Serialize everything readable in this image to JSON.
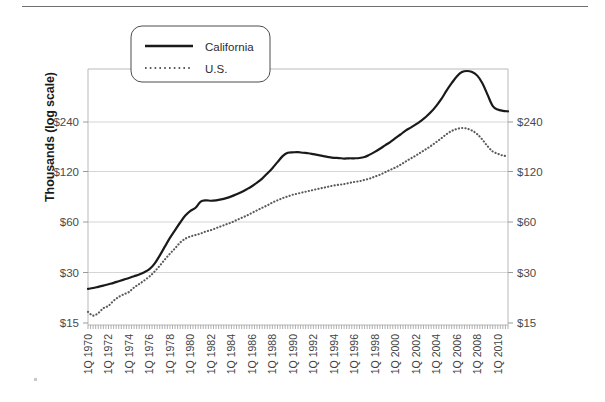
{
  "chart_data": {
    "type": "line",
    "title": "",
    "subtitle": "",
    "ylabel": "Thousands (log scale)",
    "xlabel": "",
    "yscale": "log",
    "ylim": [
      15,
      600
    ],
    "ytick_labels": [
      "$240",
      "$120",
      "$60",
      "$30",
      "$15"
    ],
    "ytick_values": [
      240,
      120,
      60,
      30,
      15
    ],
    "right_axis": true,
    "right_ytick_labels": [
      "$240",
      "$120",
      "$60",
      "$30",
      "$15"
    ],
    "grid": "horizontal",
    "legend_position": "top-left-inside",
    "legend_entries": [
      "California",
      "U.S."
    ],
    "x_tick_labels": [
      "1Q 1970",
      "1Q 1972",
      "1Q 1974",
      "1Q 1976",
      "1Q 1978",
      "1Q 1980",
      "1Q 1982",
      "1Q 1984",
      "1Q 1986",
      "1Q 1988",
      "1Q 1990",
      "1Q 1992",
      "1Q 1994",
      "1Q 1996",
      "1Q 1998",
      "1Q 2000",
      "1Q 2002",
      "1Q 2004",
      "1Q 2006",
      "1Q 2008",
      "1Q 2010"
    ],
    "x_start_year": 1970,
    "x_end_year": 2011,
    "x_unit": "quarter",
    "series": [
      {
        "name": "California",
        "style": "solid",
        "color": "#1a1a1a",
        "x": [
          1970.0,
          1970.5,
          1971.0,
          1971.5,
          1972.0,
          1972.5,
          1973.0,
          1973.5,
          1974.0,
          1974.5,
          1975.0,
          1975.5,
          1976.0,
          1976.5,
          1977.0,
          1977.5,
          1978.0,
          1978.5,
          1979.0,
          1979.5,
          1980.0,
          1980.5,
          1981.0,
          1981.5,
          1982.0,
          1982.5,
          1983.0,
          1983.5,
          1984.0,
          1984.5,
          1985.0,
          1985.5,
          1986.0,
          1986.5,
          1987.0,
          1987.5,
          1988.0,
          1988.5,
          1989.0,
          1989.5,
          1990.0,
          1990.5,
          1991.0,
          1991.5,
          1992.0,
          1992.5,
          1993.0,
          1993.5,
          1994.0,
          1994.5,
          1995.0,
          1995.5,
          1996.0,
          1996.5,
          1997.0,
          1997.5,
          1998.0,
          1998.5,
          1999.0,
          1999.5,
          2000.0,
          2000.5,
          2001.0,
          2001.5,
          2002.0,
          2002.5,
          2003.0,
          2003.5,
          2004.0,
          2004.5,
          2005.0,
          2005.5,
          2006.0,
          2006.5,
          2007.0,
          2007.5,
          2008.0,
          2008.5,
          2009.0,
          2009.5,
          2010.0,
          2010.5,
          2011.0
        ],
        "y": [
          24.0,
          24.3,
          24.7,
          25.1,
          25.6,
          26.1,
          26.7,
          27.3,
          27.9,
          28.6,
          29.3,
          30.2,
          31.5,
          34.0,
          38.0,
          43.0,
          48.5,
          54.0,
          60.0,
          66.0,
          70.5,
          73.5,
          80.0,
          81.5,
          81.0,
          81.5,
          82.5,
          84.0,
          86.0,
          88.5,
          91.5,
          95.0,
          99.0,
          104.0,
          110.0,
          118.0,
          127.0,
          138.0,
          150.0,
          157.0,
          158.0,
          158.5,
          157.0,
          156.0,
          154.0,
          152.0,
          150.0,
          148.0,
          146.5,
          146.0,
          145.0,
          145.5,
          145.5,
          146.0,
          148.0,
          153.0,
          159.0,
          166.0,
          174.0,
          182.0,
          192.0,
          202.0,
          213.0,
          222.0,
          232.0,
          244.0,
          258.0,
          276.0,
          300.0,
          330.0,
          370.0,
          410.0,
          450.0,
          478.0,
          485.0,
          478.0,
          455.0,
          410.0,
          350.0,
          300.0,
          285.0,
          280.0,
          278.0
        ]
      },
      {
        "name": "U.S.",
        "style": "dotted",
        "color": "#5a5a5a",
        "x": [
          1970.0,
          1970.5,
          1971.0,
          1971.5,
          1972.0,
          1972.5,
          1973.0,
          1973.5,
          1974.0,
          1974.5,
          1975.0,
          1975.5,
          1976.0,
          1976.5,
          1977.0,
          1977.5,
          1978.0,
          1978.5,
          1979.0,
          1979.5,
          1980.0,
          1980.5,
          1981.0,
          1981.5,
          1982.0,
          1982.5,
          1983.0,
          1983.5,
          1984.0,
          1984.5,
          1985.0,
          1985.5,
          1986.0,
          1986.5,
          1987.0,
          1987.5,
          1988.0,
          1988.5,
          1989.0,
          1989.5,
          1990.0,
          1990.5,
          1991.0,
          1991.5,
          1992.0,
          1992.5,
          1993.0,
          1993.5,
          1994.0,
          1994.5,
          1995.0,
          1995.5,
          1996.0,
          1996.5,
          1997.0,
          1997.5,
          1998.0,
          1998.5,
          1999.0,
          1999.5,
          2000.0,
          2000.5,
          2001.0,
          2001.5,
          2002.0,
          2002.5,
          2003.0,
          2003.5,
          2004.0,
          2004.5,
          2005.0,
          2005.5,
          2006.0,
          2006.5,
          2007.0,
          2007.5,
          2008.0,
          2008.5,
          2009.0,
          2009.5,
          2010.0,
          2010.5,
          2011.0
        ],
        "y": [
          17.5,
          16.6,
          17.2,
          18.4,
          19.0,
          20.4,
          21.5,
          22.3,
          23.0,
          24.5,
          25.7,
          27.0,
          28.5,
          30.5,
          33.0,
          36.0,
          39.0,
          42.0,
          45.5,
          48.0,
          49.5,
          50.5,
          51.5,
          53.0,
          54.0,
          55.5,
          57.0,
          58.5,
          60.0,
          62.0,
          64.0,
          66.0,
          68.5,
          71.0,
          73.5,
          76.0,
          79.0,
          81.5,
          84.0,
          86.0,
          88.0,
          89.5,
          91.0,
          92.5,
          94.0,
          95.5,
          97.0,
          98.5,
          100.0,
          101.0,
          102.0,
          103.5,
          105.0,
          106.0,
          108.0,
          110.0,
          113.0,
          116.0,
          120.0,
          124.0,
          128.0,
          133.0,
          139.0,
          145.0,
          151.0,
          158.0,
          165.0,
          173.0,
          182.0,
          192.0,
          203.0,
          212.0,
          218.0,
          221.0,
          219.0,
          213.0,
          203.0,
          188.0,
          172.0,
          160.0,
          155.0,
          151.0,
          150.0
        ]
      }
    ]
  }
}
